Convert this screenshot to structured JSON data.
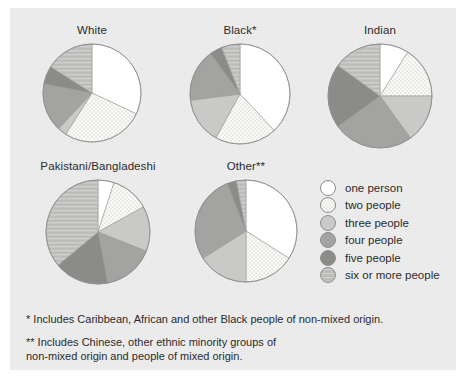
{
  "figure": {
    "background_color": "#ececed",
    "outline_color": "#8d8d8d"
  },
  "legend": {
    "items": [
      {
        "label": "one person",
        "color": "#ffffff",
        "key": "one",
        "pattern": "solid"
      },
      {
        "label": "two people",
        "color": "#f4f4f2",
        "key": "two",
        "pattern": "checker"
      },
      {
        "label": "three people",
        "color": "#c9c9c7",
        "key": "three",
        "pattern": "solid"
      },
      {
        "label": "four people",
        "color": "#a3a3a1",
        "key": "four",
        "pattern": "solid"
      },
      {
        "label": "five people",
        "color": "#8b8b8a",
        "key": "five",
        "pattern": "solid"
      },
      {
        "label": "six or more people",
        "color": "#bcbcba",
        "key": "sixplus",
        "pattern": "hatch"
      }
    ]
  },
  "notes": [
    "* Includes Caribbean, African and other Black people of non-mixed origin.",
    "** Includes Chinese, other ethnic minority groups of\n    non-mixed origin and people of mixed origin."
  ],
  "chart_data": {
    "type": "pie",
    "title": "",
    "legend_position": "right",
    "categories": [
      "one person",
      "two people",
      "three people",
      "four people",
      "five people",
      "six or more people"
    ],
    "colors": [
      "#ffffff",
      "#f4f4f2",
      "#c9c9c7",
      "#a3a3a1",
      "#8b8b8a",
      "#bcbcba"
    ],
    "unit": "percent",
    "start_angle": 0,
    "direction": "clockwise",
    "charts": [
      {
        "name": "White",
        "label": "White",
        "values": [
          32,
          27,
          3,
          16,
          6,
          16
        ]
      },
      {
        "name": "Black",
        "label": "Black*",
        "values": [
          38,
          20,
          15,
          17,
          4,
          6
        ]
      },
      {
        "name": "Indian",
        "label": "Indian",
        "values": [
          9,
          16,
          15,
          25,
          20,
          15
        ]
      },
      {
        "name": "Pakistani/Bangladeshi",
        "label": "Pakistani/Bangladeshi",
        "values": [
          5,
          12,
          14,
          16,
          17,
          36
        ]
      },
      {
        "name": "Other",
        "label": "Other**",
        "values": [
          34,
          16,
          16,
          28,
          3,
          3
        ]
      }
    ]
  },
  "layout": {
    "pies": [
      {
        "chart": 0,
        "left": 18,
        "top": 24,
        "size": 148,
        "radius": 49
      },
      {
        "chart": 1,
        "left": 166,
        "top": 24,
        "size": 148,
        "radius": 50
      },
      {
        "chart": 2,
        "left": 306,
        "top": 24,
        "size": 148,
        "radius": 52
      },
      {
        "chart": 3,
        "left": 14,
        "top": 160,
        "size": 168,
        "radius": 52
      },
      {
        "chart": 4,
        "left": 172,
        "top": 160,
        "size": 148,
        "radius": 51
      }
    ],
    "legend_box": {
      "left": 320,
      "top": 179
    }
  }
}
